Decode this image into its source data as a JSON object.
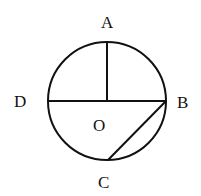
{
  "diagram": {
    "type": "circle-geometry",
    "circle": {
      "cx": 107,
      "cy": 101,
      "r": 59,
      "stroke": "#111111"
    },
    "points": {
      "A": {
        "label": "A",
        "x": 107,
        "y": 42
      },
      "B": {
        "label": "B",
        "x": 166,
        "y": 101
      },
      "C": {
        "label": "C",
        "x": 108,
        "y": 160
      },
      "D": {
        "label": "D",
        "x": 48,
        "y": 101
      },
      "O": {
        "label": "O",
        "x": 107,
        "y": 101
      }
    },
    "labels": {
      "A": "A",
      "B": "B",
      "C": "C",
      "D": "D",
      "O": "O"
    },
    "segments": [
      {
        "name": "OA",
        "from": "O",
        "to": "A"
      },
      {
        "name": "DB",
        "from": "D",
        "to": "B"
      },
      {
        "name": "BC",
        "from": "B",
        "to": "C"
      }
    ]
  }
}
